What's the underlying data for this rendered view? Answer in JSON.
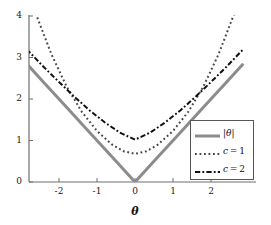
{
  "chart_data": {
    "type": "line",
    "title": "",
    "xlabel": "θ",
    "ylabel": "",
    "xlim": [
      -2.85,
      2.85
    ],
    "ylim": [
      0,
      4.1
    ],
    "grid": false,
    "legend_position": "lower-right",
    "xticks": [
      -2,
      -1,
      0,
      1,
      2
    ],
    "xtick_labels": [
      "-2",
      "-1",
      "0",
      "1",
      "2"
    ],
    "yticks": [
      0,
      1,
      2,
      3,
      4
    ],
    "ytick_labels": [
      "0",
      "1",
      "2",
      "3",
      "4"
    ],
    "series": [
      {
        "name": "|θ|",
        "style": "solid",
        "color": "#8c8c8c",
        "width": 3,
        "x": [
          -2.85,
          -2.4,
          -1.8,
          -1.2,
          -0.6,
          0,
          0.6,
          1.2,
          1.8,
          2.4,
          2.85
        ],
        "values": [
          2.85,
          2.4,
          1.8,
          1.2,
          0.6,
          0,
          0.6,
          1.2,
          1.8,
          2.4,
          2.85
        ]
      },
      {
        "name": "c = 1",
        "style": "dotted",
        "color": "#444444",
        "width": 2,
        "x": [
          -2.85,
          -2.6,
          -2.2,
          -1.8,
          -1.4,
          -1.0,
          -0.6,
          -0.3,
          0,
          0.3,
          0.6,
          1.0,
          1.4,
          1.8,
          2.2,
          2.6,
          2.85
        ],
        "values": [
          4.68,
          4.03,
          3.08,
          2.3,
          1.69,
          1.23,
          0.9,
          0.74,
          0.68,
          0.74,
          0.9,
          1.23,
          1.69,
          2.3,
          3.08,
          4.03,
          4.68
        ]
      },
      {
        "name": "c = 2",
        "style": "dashdot",
        "color": "#111111",
        "width": 2,
        "x": [
          -2.85,
          -2.4,
          -2.0,
          -1.6,
          -1.2,
          -0.8,
          -0.4,
          0,
          0.4,
          0.8,
          1.2,
          1.6,
          2.0,
          2.4,
          2.85
        ],
        "values": [
          3.2,
          2.77,
          2.41,
          2.06,
          1.73,
          1.44,
          1.19,
          1.02,
          1.19,
          1.44,
          1.73,
          2.06,
          2.41,
          2.77,
          3.2
        ]
      }
    ],
    "legend_entries": [
      {
        "label": "|θ|",
        "style": "solid",
        "color": "#8c8c8c"
      },
      {
        "label": "c = 1",
        "style": "dotted",
        "color": "#444444"
      },
      {
        "label": "c = 2",
        "style": "dashdot",
        "color": "#111111"
      }
    ]
  },
  "axes": {
    "x_title": "θ"
  }
}
